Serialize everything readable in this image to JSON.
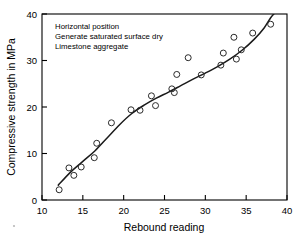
{
  "chart_data": {
    "type": "scatter",
    "title": "",
    "xlabel": "Rebound reading",
    "ylabel": "Compressive strength in MPa",
    "xlim": [
      10,
      40
    ],
    "ylim": [
      0,
      40
    ],
    "xticks": [
      10,
      15,
      20,
      25,
      30,
      35,
      40
    ],
    "yticks": [
      0,
      10,
      20,
      30,
      40
    ],
    "grid": false,
    "legend": null,
    "annotations": [
      "Horizontal position",
      "Generate saturated surface dry",
      "Limestone aggregate"
    ],
    "marker": "open-circle",
    "points": [
      {
        "x": 12.1,
        "y": 2.2
      },
      {
        "x": 13.3,
        "y": 6.9
      },
      {
        "x": 13.9,
        "y": 5.3
      },
      {
        "x": 14.8,
        "y": 7.1
      },
      {
        "x": 16.4,
        "y": 9.1
      },
      {
        "x": 16.7,
        "y": 12.2
      },
      {
        "x": 18.5,
        "y": 16.6
      },
      {
        "x": 20.9,
        "y": 19.4
      },
      {
        "x": 22.0,
        "y": 19.3
      },
      {
        "x": 23.4,
        "y": 22.4
      },
      {
        "x": 23.9,
        "y": 20.3
      },
      {
        "x": 25.9,
        "y": 23.9
      },
      {
        "x": 26.2,
        "y": 23.1
      },
      {
        "x": 26.5,
        "y": 27.0
      },
      {
        "x": 27.9,
        "y": 30.6
      },
      {
        "x": 29.5,
        "y": 26.9
      },
      {
        "x": 31.9,
        "y": 29.0
      },
      {
        "x": 32.2,
        "y": 31.6
      },
      {
        "x": 33.5,
        "y": 35.0
      },
      {
        "x": 33.8,
        "y": 30.3
      },
      {
        "x": 34.4,
        "y": 32.3
      },
      {
        "x": 35.8,
        "y": 35.9
      },
      {
        "x": 38.0,
        "y": 37.8
      }
    ],
    "fit_curve": [
      {
        "x": 12.0,
        "y": 3.2
      },
      {
        "x": 13.5,
        "y": 6.0
      },
      {
        "x": 15.0,
        "y": 8.3
      },
      {
        "x": 16.5,
        "y": 10.6
      },
      {
        "x": 18.0,
        "y": 13.4
      },
      {
        "x": 19.5,
        "y": 16.2
      },
      {
        "x": 21.0,
        "y": 18.6
      },
      {
        "x": 22.5,
        "y": 20.4
      },
      {
        "x": 24.0,
        "y": 21.9
      },
      {
        "x": 25.5,
        "y": 23.2
      },
      {
        "x": 27.0,
        "y": 24.6
      },
      {
        "x": 28.5,
        "y": 26.0
      },
      {
        "x": 30.0,
        "y": 27.3
      },
      {
        "x": 31.5,
        "y": 28.7
      },
      {
        "x": 33.0,
        "y": 30.3
      },
      {
        "x": 34.5,
        "y": 32.2
      },
      {
        "x": 36.0,
        "y": 34.6
      },
      {
        "x": 37.2,
        "y": 37.0
      },
      {
        "x": 38.0,
        "y": 39.2
      },
      {
        "x": 38.5,
        "y": 40.2
      }
    ],
    "colors": {
      "axis": "#000000",
      "marker_edge": "#2b2b2b",
      "fit_line": "#1a1a1a",
      "background": "#ffffff"
    }
  }
}
